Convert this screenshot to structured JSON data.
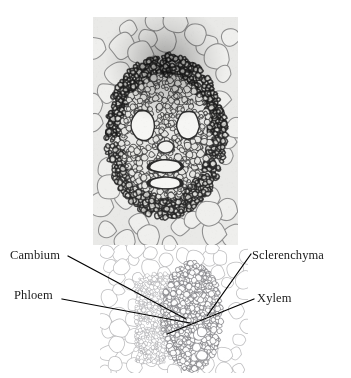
{
  "figure": {
    "background_color": "#ffffff",
    "text_color": "#1b1b1b",
    "leader_line_color": "#000000"
  },
  "panels": [
    {
      "name": "vascular-bundle-closeup",
      "description": "High magnification micrograph of a monocot vascular bundle showing two large metaxylem vessels flanking the center, surrounded by sclerenchyma fibers and large parenchyma cells",
      "x": 93,
      "y": 17,
      "width": 145,
      "height": 228,
      "tone": "dark",
      "cell_wall_color": "#3a3a3a",
      "cell_lumen_color": "#e8e8e6",
      "matrix_color": "#e9e9e7"
    },
    {
      "name": "vascular-bundle-widefield",
      "description": "Lower magnification micrograph of the same tissue showing phloem, cambium, xylem and sclerenchyma regions in pale outline",
      "x": 100,
      "y": 245,
      "width": 148,
      "height": 128,
      "tone": "light",
      "cell_wall_color": "#b9b9bb",
      "cell_lumen_color": "#ffffff",
      "matrix_color": "#ffffff"
    }
  ],
  "labels": [
    {
      "id": "cambium",
      "text": "Cambium",
      "side": "left",
      "x": 10,
      "y": 249,
      "leader": {
        "x1": 68,
        "y1": 256,
        "x2": 186,
        "y2": 319
      }
    },
    {
      "id": "phloem",
      "text": "Phloem",
      "side": "left",
      "x": 14,
      "y": 289,
      "leader": {
        "x1": 62,
        "y1": 299,
        "x2": 190,
        "y2": 323
      }
    },
    {
      "id": "sclerenchyma",
      "text": "Sclerenchyma",
      "side": "right",
      "x": 252,
      "y": 249,
      "leader": {
        "x1": 251,
        "y1": 254,
        "x2": 207,
        "y2": 316
      }
    },
    {
      "id": "xylem",
      "text": "Xylem",
      "side": "right",
      "x": 257,
      "y": 292,
      "leader": {
        "x1": 254,
        "y1": 299,
        "x2": 167,
        "y2": 334
      }
    }
  ]
}
